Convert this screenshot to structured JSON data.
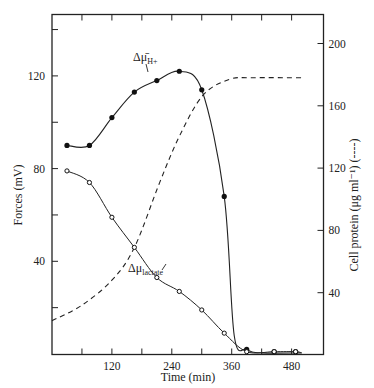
{
  "chart_data": {
    "type": "line",
    "title": "",
    "xlabel": "Time (min)",
    "ylabel": "Forces (mV)",
    "ylabel_right": "Cell protein (μg ml⁻¹) (----)",
    "xlim": [
      0,
      540
    ],
    "ylim": [
      0,
      150
    ],
    "ylim_right": [
      0,
      220
    ],
    "x_ticks": [
      120,
      240,
      360,
      480
    ],
    "x_minor_ticks": [
      60,
      180,
      300,
      420
    ],
    "y_ticks": [
      40,
      80,
      120
    ],
    "y_minor_ticks": [
      20,
      60,
      100,
      140
    ],
    "y_ticks_right": [
      40,
      80,
      120,
      160,
      200
    ],
    "grid": false,
    "series": [
      {
        "name": "Δμ̄H+",
        "axis": "left",
        "marker": "filled-circle",
        "line": "solid",
        "x": [
          30,
          75,
          120,
          165,
          210,
          255,
          300,
          345,
          390,
          445,
          488
        ],
        "values": [
          90,
          90,
          102,
          113,
          118,
          122,
          114,
          68,
          2,
          1,
          1
        ]
      },
      {
        "name": "Δμlactate",
        "axis": "left",
        "marker": "open-circle",
        "line": "solid",
        "x": [
          30,
          75,
          120,
          165,
          210,
          255,
          300,
          345,
          390,
          445,
          488
        ],
        "values": [
          79,
          74,
          59,
          46,
          33,
          27,
          19,
          9,
          1,
          1,
          1
        ]
      },
      {
        "name": "Cell protein",
        "axis": "right",
        "marker": "none",
        "line": "dashed",
        "x": [
          0,
          60,
          120,
          165,
          216,
          256,
          303,
          356,
          400,
          502
        ],
        "values": [
          22,
          32,
          48,
          69,
          111,
          141,
          167,
          177,
          178,
          178
        ]
      }
    ],
    "annotations": [
      {
        "text": "Δμ̄",
        "sub": "H+",
        "target": "Δμ̄H+"
      },
      {
        "text": "Δμ",
        "sub": "lactate",
        "target": "Δμlactate"
      }
    ],
    "legend": "none"
  },
  "labels": {
    "x_title": "Time (min)",
    "y_title": "Forces (mV)",
    "y_right_title": "Cell protein (μg ml⁻¹) (----)",
    "x_tick_labels": [
      "120",
      "240",
      "360",
      "480"
    ],
    "y_tick_labels": [
      "40",
      "80",
      "120"
    ],
    "y_right_tick_labels": [
      "40",
      "80",
      "120",
      "160",
      "200"
    ],
    "anno_h_main": "Δμ̄",
    "anno_h_sub": "H+",
    "anno_lac_main": "Δμ",
    "anno_lac_sub": "lactate"
  }
}
